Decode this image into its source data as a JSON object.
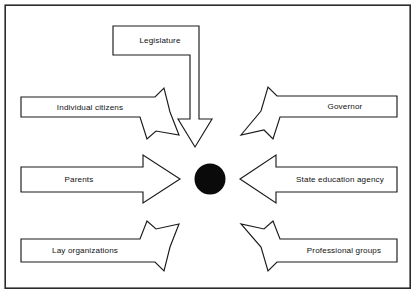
{
  "diagram": {
    "type": "convergent-arrow-diagram",
    "frame": {
      "stroke_color": "#2b2b2b",
      "background_color": "#ffffff"
    },
    "hub": {
      "name": "center-node",
      "label": "",
      "fill_color": "#0a0a0a",
      "cx": 210,
      "cy": 179,
      "r": 15.5
    },
    "nodes": [
      {
        "id": "legislature",
        "label": "Legislature",
        "direction": "down",
        "label_x": 160,
        "label_y": 43
      },
      {
        "id": "individual-citizens",
        "label": "Individual citizens",
        "direction": "down-right",
        "label_x": 90,
        "label_y": 108
      },
      {
        "id": "governor",
        "label": "Governor",
        "direction": "down-left",
        "label_x": 344,
        "label_y": 108
      },
      {
        "id": "parents",
        "label": "Parents",
        "direction": "right",
        "label_x": 78,
        "label_y": 181
      },
      {
        "id": "state-education-agency",
        "label": "State education agency",
        "direction": "left",
        "label_x": 339,
        "label_y": 181
      },
      {
        "id": "lay-organizations",
        "label": "Lay organizations",
        "direction": "up-right",
        "label_x": 85,
        "label_y": 245
      },
      {
        "id": "professional-groups",
        "label": "Professional groups",
        "direction": "up-left",
        "label_x": 343,
        "label_y": 245
      }
    ]
  }
}
